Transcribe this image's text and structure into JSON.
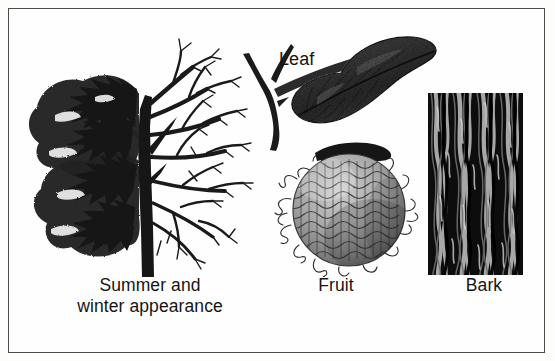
{
  "plate": {
    "title": "Tree identification plate",
    "background_color": "#fefefe",
    "border_color": "#4b4b4b",
    "ink_color": "#151515",
    "style": "black-and-white scanned halftone engraving"
  },
  "labels": {
    "tree": "Summer and\nwinter appearance",
    "tree_line1": "Summer and",
    "tree_line2": "winter appearance",
    "leaf": "Leaf",
    "fruit": "Fruit",
    "bark": "Bark"
  },
  "figures": [
    {
      "name": "tree",
      "caption": "Summer and winter appearance",
      "description": "Single tree drawn split down the trunk: dense dark foliage on the left half (summer), bare branching twigs on the right half (winter)",
      "halves": [
        "summer foliage",
        "winter bare branches"
      ]
    },
    {
      "name": "leaf",
      "caption": "Leaf",
      "description": "Dark ovate-lanceolate leaf with an acuminate tip and pinnate venation, attached by a petiole to a thorny Y-shaped twig"
    },
    {
      "name": "fruit",
      "caption": "Fruit",
      "description": "Large round warty multiple fruit (osage orange) with a knobby pebbled surface, wispy filaments around the rim and a dark woody stem across the top"
    },
    {
      "name": "bark",
      "caption": "Bark",
      "description": "Rectangular swatch of dark bark with deep vertical interlacing furrows and ridges"
    }
  ]
}
